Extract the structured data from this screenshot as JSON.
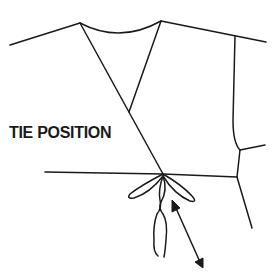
{
  "diagram": {
    "type": "garment-technical-sketch",
    "annotation": {
      "label": "TIE POSITION",
      "indicator": "double-headed-arrow"
    },
    "colors": {
      "line": "#1a1a1a",
      "background": "#ffffff"
    }
  }
}
